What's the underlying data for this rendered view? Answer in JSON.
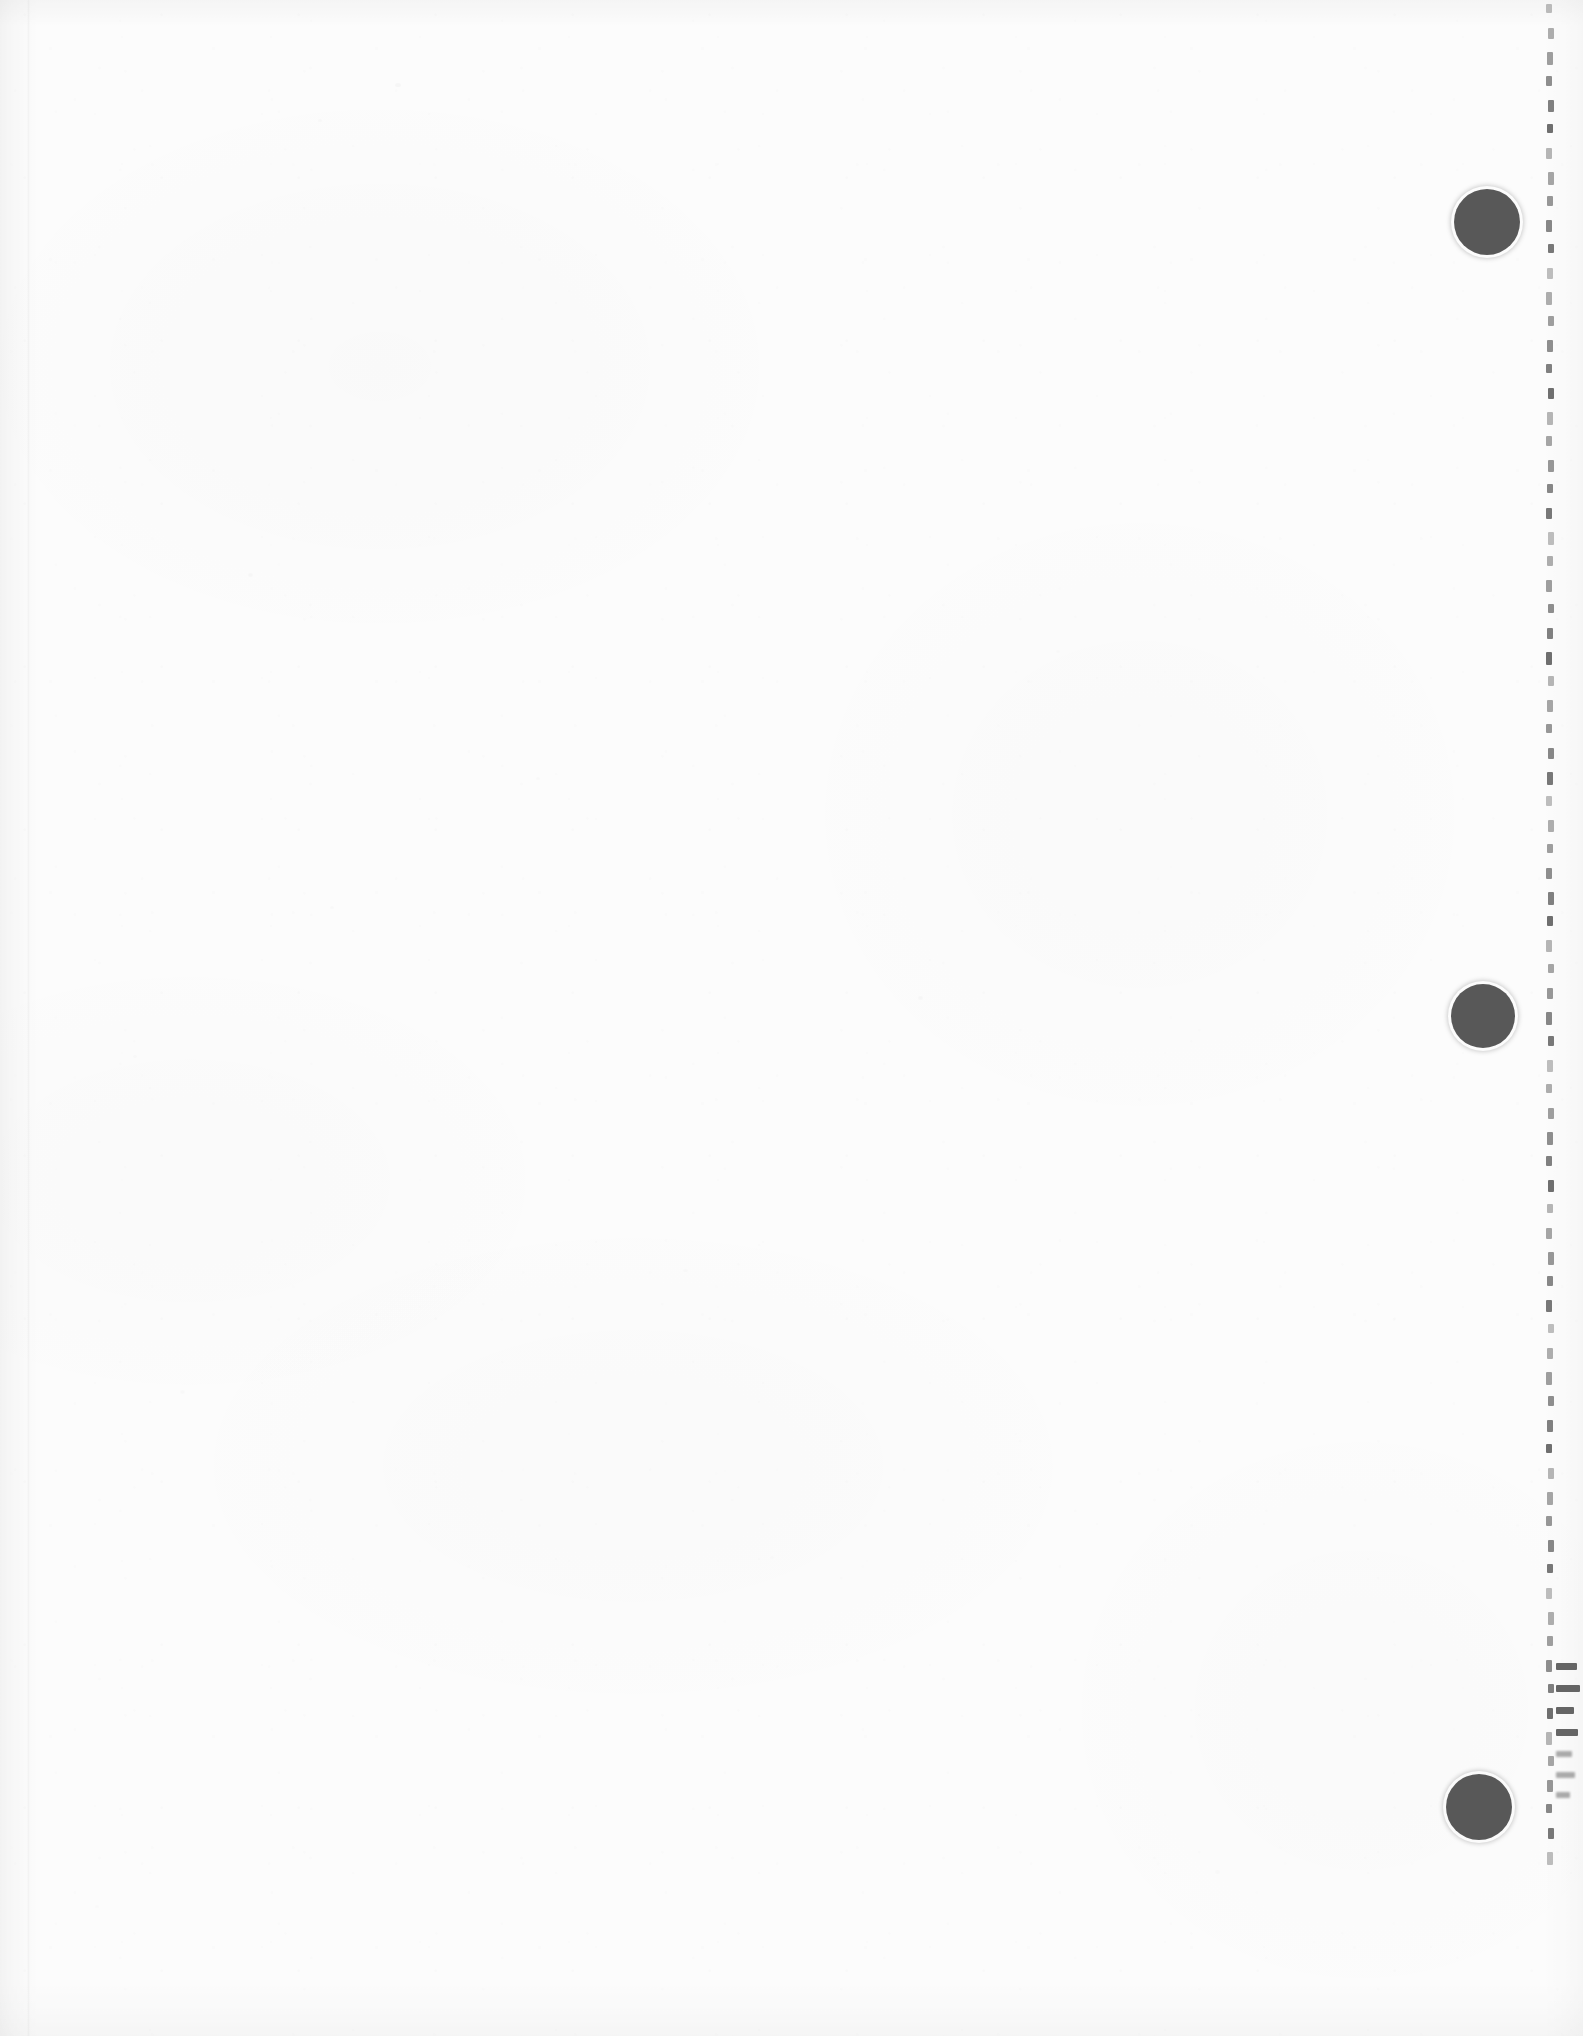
{
  "document": {
    "type": "scanned-blank-page",
    "title": "Scanned blank separator page",
    "page_width": 1583,
    "page_height": 2036,
    "background_color": "#fdfdfd",
    "ink_color": "#030303",
    "visible_text": "",
    "text_note": "No legible text is present on this page."
  },
  "marks": {
    "punch_dots": {
      "label": "black filled circles",
      "count": 3,
      "color": "#030303",
      "items": [
        {
          "name": "punch-dot-top",
          "cx": 1487,
          "cy": 222,
          "diameter": 66
        },
        {
          "name": "punch-dot-middle",
          "cx": 1483,
          "cy": 1016,
          "diameter": 64
        },
        {
          "name": "punch-dot-bottom",
          "cx": 1479,
          "cy": 1807,
          "diameter": 66
        }
      ]
    },
    "perforation_line": {
      "label": "vertical dashed perforation line",
      "x": 1547,
      "y_start": 4,
      "y_end": 1852,
      "tick_spacing": 24,
      "tick_length": 11,
      "color": "#1b1b1b"
    },
    "edge_dashes": {
      "label": "horizontal tear marks at right edge",
      "x": 1556,
      "y_start": 1662,
      "y_end": 1792,
      "spacing": 21,
      "color": "#161616",
      "count": 7
    }
  },
  "colors": {
    "paper": "#fdfdfd",
    "paper_shadow": "#f1f1f1",
    "ink": "#030303",
    "perf_ink": "#1b1b1b"
  }
}
